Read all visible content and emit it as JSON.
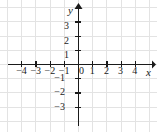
{
  "figure": {
    "title": "",
    "width": 157,
    "height": 132,
    "background_color": "#ffffff",
    "axis_color": "#1a1a1a",
    "grid_color": "#e3e3e3",
    "label_color": "#1a1a1a",
    "origin_label": "0",
    "x_axis_name": "x",
    "y_axis_name": "y"
  },
  "chart_data": {
    "type": "scatter",
    "title": "",
    "xlabel": "x",
    "ylabel": "y",
    "xlim": [
      -5,
      5
    ],
    "ylim": [
      -4,
      4
    ],
    "grid": true,
    "legend": null,
    "series": [
      {
        "name": "",
        "x": [],
        "y": []
      }
    ],
    "x_ticks": [
      -4,
      -3,
      -2,
      -1,
      0,
      1,
      2,
      3,
      4
    ],
    "y_ticks": [
      -3,
      -2,
      -1,
      1,
      2,
      3
    ],
    "x_tick_labels": [
      "-4",
      "-3",
      "-2",
      "-1",
      "0",
      "1",
      "2",
      "3",
      "4"
    ],
    "y_tick_labels": [
      "-3",
      "-2",
      "-1",
      "1",
      "2",
      "3"
    ],
    "annotations": []
  },
  "geometry": {
    "origin_x": 78,
    "origin_y": 64,
    "unit_px": 14.2,
    "x_axis_start": 8,
    "x_axis_end": 152,
    "y_axis_start": 8,
    "y_axis_end": 126,
    "tick_half": 3
  },
  "x_labels": [
    {
      "text": "-4",
      "value": -4,
      "left": 21.2,
      "top": 66
    },
    {
      "text": "-3",
      "value": -3,
      "left": 35.4,
      "top": 66
    },
    {
      "text": "-2",
      "value": -2,
      "left": 49.6,
      "top": 66
    },
    {
      "text": "-1",
      "value": -1,
      "left": 63.8,
      "top": 66
    },
    {
      "text": "1",
      "value": 1,
      "left": 92.2,
      "top": 66
    },
    {
      "text": "2",
      "value": 2,
      "left": 106.4,
      "top": 66
    },
    {
      "text": "3",
      "value": 3,
      "left": 120.6,
      "top": 66
    },
    {
      "text": "4",
      "value": 4,
      "left": 134.8,
      "top": 66
    }
  ],
  "y_labels": [
    {
      "text": "3",
      "value": 3,
      "left": 69,
      "top": 21.4
    },
    {
      "text": "2",
      "value": 2,
      "left": 69,
      "top": 35.6
    },
    {
      "text": "1",
      "value": 1,
      "left": 69,
      "top": 49.8
    },
    {
      "text": "-1",
      "value": -1,
      "left": 65,
      "top": 73.2
    },
    {
      "text": "-2",
      "value": -2,
      "left": 65,
      "top": 87.4
    },
    {
      "text": "-3",
      "value": -3,
      "left": 65,
      "top": 101.6
    }
  ],
  "origin": {
    "text": "0",
    "left": 79,
    "top": 66
  },
  "axis_names": {
    "x": {
      "text": "x",
      "left": 146,
      "top": 67
    },
    "y": {
      "text": "y",
      "left": 68,
      "top": 5
    }
  }
}
